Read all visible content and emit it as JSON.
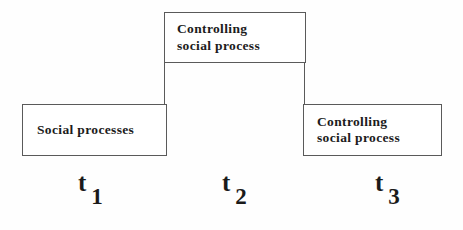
{
  "diagram": {
    "type": "step-process-timeline",
    "background_color": "#fefefe",
    "line_color": "#5a5a5a",
    "text_color": "#1c1c1c",
    "boxes": [
      {
        "id": "social-processes",
        "label": "Social  processes",
        "time": "t1"
      },
      {
        "id": "controlling-social-process-t2",
        "label": "Controlling\nsocial  process",
        "time": "t2"
      },
      {
        "id": "controlling-social-process-t3",
        "label": "Controlling\nsocial  process",
        "time": "t3"
      }
    ],
    "time_labels": [
      {
        "base": "t",
        "subscript": "1"
      },
      {
        "base": "t",
        "subscript": "2"
      },
      {
        "base": "t",
        "subscript": "3"
      }
    ]
  }
}
